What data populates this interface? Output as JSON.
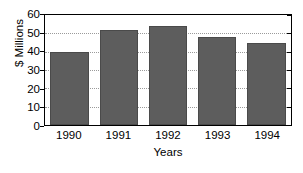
{
  "chart_data": {
    "type": "bar",
    "title": "",
    "subtitle": "",
    "xlabel": "Years",
    "ylabel": "$ Millions",
    "categories": [
      "1990",
      "1991",
      "1992",
      "1993",
      "1994"
    ],
    "values": [
      40,
      52,
      54,
      48,
      45
    ],
    "series": [
      {
        "name": "",
        "values": [
          40,
          52,
          54,
          48,
          45
        ]
      }
    ],
    "ylim": [
      0,
      60
    ],
    "ytick_values": [
      0,
      10,
      20,
      30,
      40,
      50,
      60
    ],
    "ytick_labels": [
      "0",
      "10",
      "20",
      "30",
      "40",
      "50",
      "60"
    ],
    "ytick_step": 10,
    "grid": true,
    "grid_axis": "y",
    "grid_style": "dotted",
    "legend": false,
    "legend_position": "none",
    "bar_color": "#5d5d5d",
    "bar_edge_color": "#4a4a4a",
    "grid_color": "#9a9a9a",
    "axis_color": "#000000",
    "background_color": "#ffffff"
  }
}
